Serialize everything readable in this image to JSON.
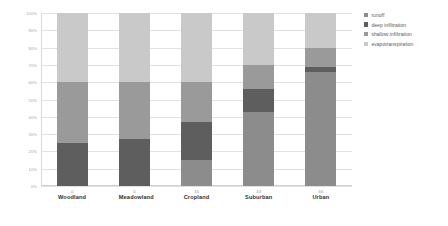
{
  "chart_data": {
    "type": "bar",
    "subtype": "stacked-100-percent",
    "title": "",
    "xlabel": "",
    "ylabel": "",
    "ylim": [
      0,
      100
    ],
    "ytick_labels": [
      "100%",
      "90%",
      "80%",
      "70%",
      "60%",
      "50%",
      "40%",
      "30%",
      "20%",
      "10%",
      "0%"
    ],
    "ytick_values": [
      100,
      90,
      80,
      70,
      60,
      50,
      40,
      30,
      20,
      10,
      0
    ],
    "grid": true,
    "legend_position": "right",
    "categories": [
      "Woodland",
      "Meadowland",
      "Cropland",
      "Suburban",
      "Urban"
    ],
    "data_labels": [
      "0",
      "0",
      "15",
      "43",
      "66"
    ],
    "series": [
      {
        "name": "runoff",
        "color": "#8c8c8c",
        "values": [
          0,
          0,
          15,
          43,
          66
        ]
      },
      {
        "name": "deep infiltration",
        "color": "#5e5e5e",
        "values": [
          25,
          27,
          22,
          13,
          3
        ]
      },
      {
        "name": "shallow infiltration",
        "color": "#9a9a9a",
        "values": [
          35,
          33,
          23,
          14,
          11
        ]
      },
      {
        "name": "evapotranspiration",
        "color": "#c9c9c9",
        "values": [
          40,
          40,
          40,
          30,
          20
        ]
      }
    ]
  },
  "legend": {
    "items": [
      {
        "label": "runoff",
        "color": "#8c8c8c"
      },
      {
        "label": "deep infiltration",
        "color": "#5e5e5e"
      },
      {
        "label": "shallow infiltration",
        "color": "#9a9a9a"
      },
      {
        "label": "evapotranspiration",
        "color": "#c9c9c9"
      }
    ]
  }
}
